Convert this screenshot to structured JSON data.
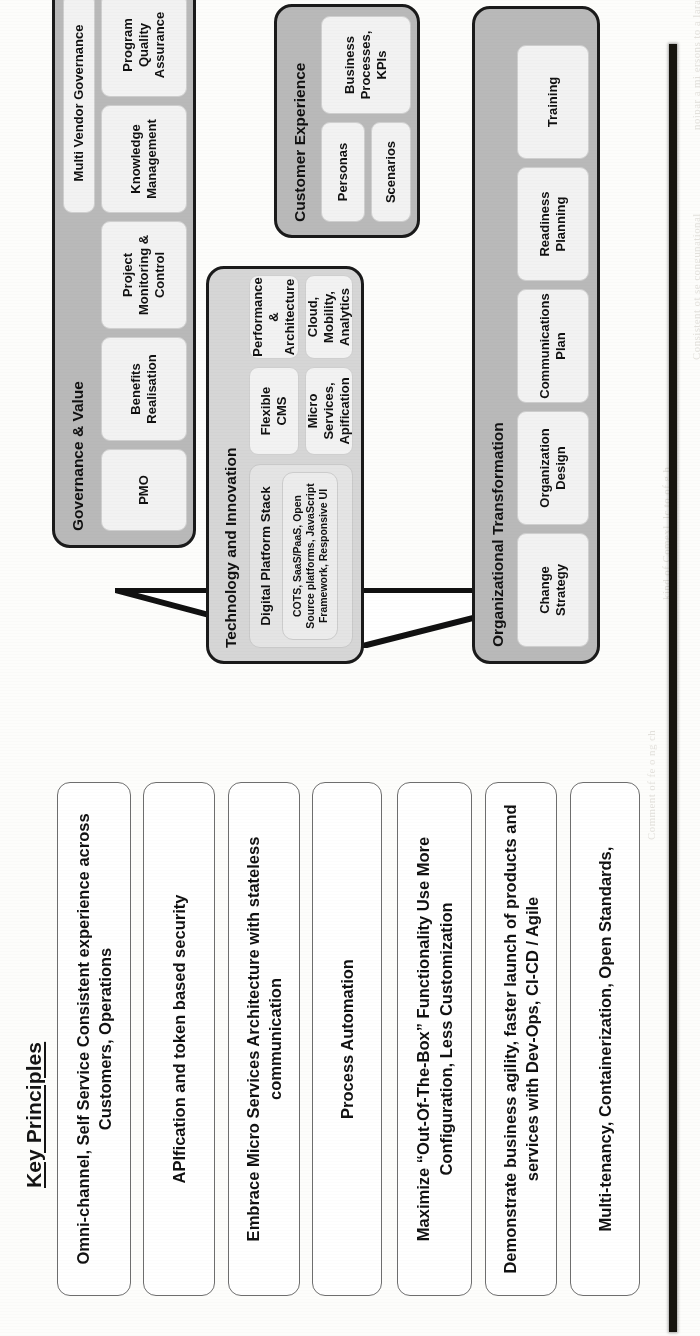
{
  "diagram": {
    "key_principles": {
      "title": "Key Principles",
      "items": [
        {
          "text": "Omni-channel, Self Service\nConsistent experience across Customers, Operations"
        },
        {
          "text": "APIfication and token based security"
        },
        {
          "text": "Embrace Micro Services Architecture with stateless communication"
        },
        {
          "text": "Process Automation"
        },
        {
          "text": "Maximize “Out-Of-The-Box” Functionality Use More Configuration, Less Customization"
        },
        {
          "text": "Demonstrate business agility, faster launch of products and services with Dev-Ops, CI-CD / Agile"
        },
        {
          "text": "Multi-tenancy, Containerization, Open Standards,"
        }
      ]
    },
    "panels": [
      {
        "id": "governance-and-value",
        "title": "Governance & Value",
        "items": [
          {
            "label": "PMO"
          },
          {
            "label": "Benefits Realisation"
          },
          {
            "label": "Project Monitoring & Control"
          },
          {
            "label": "Knowledge Management"
          },
          {
            "label": "Program Quality Assurance"
          },
          {
            "label": "Multi Vendor Governance"
          }
        ]
      },
      {
        "id": "technology-and-innovation",
        "title": "Technology and Innovation",
        "items": [
          {
            "label": "Digital Platform Stack"
          },
          {
            "label": "COTS, SaaS/PaaS, Open Source platforms, JavaScript Framework, Responsive UI"
          },
          {
            "label": "Flexible CMS"
          },
          {
            "label": "Micro Services, Apification"
          },
          {
            "label": "Performance & Architecture"
          },
          {
            "label": "Cloud, Mobility, Analytics"
          }
        ]
      },
      {
        "id": "customer-experience",
        "title": "Customer Experience",
        "items": [
          {
            "label": "Personas"
          },
          {
            "label": "Scenarios"
          },
          {
            "label": "Business Processes, KPIs"
          }
        ]
      },
      {
        "id": "organizational-transformation",
        "title": "Organizational Transformation",
        "items": [
          {
            "label": "Change Strategy"
          },
          {
            "label": "Organization Design"
          },
          {
            "label": "Communications Plan"
          },
          {
            "label": "Readiness Planning"
          },
          {
            "label": "Training"
          }
        ]
      }
    ]
  },
  "colors": {
    "panel_fill": "#b9b9b9",
    "panel_fill_light": "#d6d6d6",
    "panel_border": "#1a1a1a",
    "sub_fill": "#f2f2f2",
    "text": "#111111",
    "spine": "#17150f"
  }
}
